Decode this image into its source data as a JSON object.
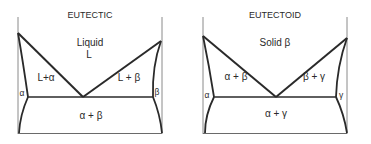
{
  "diagrams": [
    {
      "title": "EUTECTIC",
      "top_label_line1": "Liquid",
      "top_label_line2": "L",
      "left_two_phase": "L+α",
      "right_two_phase": "L + β",
      "left_single": "α",
      "right_single": "β",
      "bottom_two_phase": "α + β"
    },
    {
      "title": "EUTECTOID",
      "top_label_line1": "Solid β",
      "left_two_phase": "α + β",
      "right_two_phase": "β + γ",
      "left_single": "α",
      "right_single": "γ",
      "bottom_two_phase": "α + γ"
    }
  ],
  "colors": {
    "line": "#2a2a2a",
    "axis": "#7a7a7a",
    "background": "#ffffff"
  }
}
